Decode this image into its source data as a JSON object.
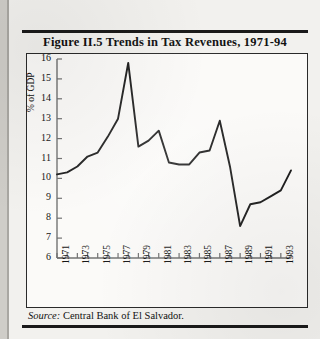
{
  "figure": {
    "title": "Figure II.5  Trends in Tax Revenues, 1971-94",
    "source_label": "Source:",
    "source_text": "Central Bank of El Salvador."
  },
  "chart_data": {
    "type": "line",
    "title": "Figure II.5  Trends in Tax Revenues, 1971-94",
    "xlabel": "",
    "ylabel": "% of GDP",
    "ylim": [
      6,
      16
    ],
    "xlim": [
      1971,
      1994
    ],
    "yticks": [
      6,
      7,
      8,
      9,
      10,
      11,
      12,
      13,
      14,
      15,
      16
    ],
    "xticks": [
      1971,
      1972,
      1973,
      1974,
      1975,
      1976,
      1977,
      1978,
      1979,
      1980,
      1981,
      1982,
      1983,
      1984,
      1985,
      1986,
      1987,
      1988,
      1989,
      1990,
      1991,
      1992,
      1993,
      1994
    ],
    "xtick_labels": [
      "1971",
      "",
      "1973",
      "",
      "1975",
      "",
      "1977",
      "",
      "1979",
      "",
      "1981",
      "",
      "1983",
      "",
      "1985",
      "",
      "1987",
      "",
      "1989",
      "",
      "1991",
      "",
      "1993",
      ""
    ],
    "grid": false,
    "legend": "none",
    "line_color": "#1a1a1a",
    "x": [
      1971,
      1972,
      1973,
      1974,
      1975,
      1976,
      1977,
      1978,
      1979,
      1980,
      1981,
      1982,
      1983,
      1984,
      1985,
      1986,
      1987,
      1988,
      1989,
      1990,
      1991,
      1992,
      1993,
      1994
    ],
    "values": [
      10.2,
      10.3,
      10.6,
      11.1,
      11.3,
      12.1,
      13.0,
      15.8,
      11.6,
      11.9,
      12.4,
      10.8,
      10.7,
      10.7,
      11.3,
      11.4,
      12.9,
      10.6,
      7.6,
      8.7,
      8.8,
      9.1,
      9.4,
      10.4
    ]
  }
}
